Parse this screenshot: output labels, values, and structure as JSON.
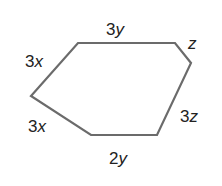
{
  "figure": {
    "type": "hexagon",
    "stroke_color": "#6b6b6b",
    "label_color": "#222222",
    "vertices": [
      [
        78,
        43
      ],
      [
        175,
        43
      ],
      [
        191,
        63
      ],
      [
        157,
        135
      ],
      [
        91,
        135
      ],
      [
        31,
        96
      ]
    ],
    "sides": [
      {
        "coef": "3",
        "var": "y",
        "x": 106,
        "y": 35
      },
      {
        "coef": "",
        "var": "z",
        "x": 188,
        "y": 49
      },
      {
        "coef": "3",
        "var": "z",
        "x": 180,
        "y": 122
      },
      {
        "coef": "2",
        "var": "y",
        "x": 109,
        "y": 164
      },
      {
        "coef": "3",
        "var": "x",
        "x": 28,
        "y": 132
      },
      {
        "coef": "3",
        "var": "x",
        "x": 25,
        "y": 67
      }
    ]
  }
}
